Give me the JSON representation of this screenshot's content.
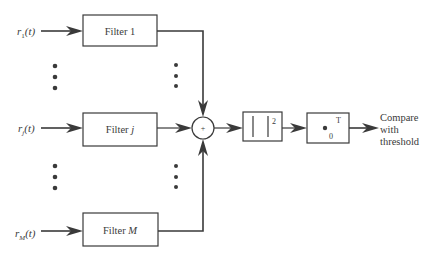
{
  "diagram": {
    "type": "block-diagram",
    "inputs": [
      {
        "id": "r1",
        "base": "r",
        "sub": "1",
        "arg": "(t)"
      },
      {
        "id": "rj",
        "base": "r",
        "sub": "j",
        "arg": "(t)"
      },
      {
        "id": "rM",
        "base": "r",
        "sub": "M",
        "arg": "(t)"
      }
    ],
    "filters": [
      {
        "id": "filter-1",
        "prefix": "Filter ",
        "index": "1",
        "index_italic": false
      },
      {
        "id": "filter-j",
        "prefix": "Filter ",
        "index": "j",
        "index_italic": true
      },
      {
        "id": "filter-m",
        "prefix": "Filter ",
        "index": "M",
        "index_italic": true
      }
    ],
    "summer": {
      "symbol": "+"
    },
    "magnitude_squared": {
      "exponent": "2"
    },
    "integrator": {
      "upper_limit": "T",
      "lower_limit": "0"
    },
    "output": {
      "lines": [
        "Compare",
        "with",
        "threshold"
      ]
    },
    "ellipsis": "vertical-dots"
  }
}
